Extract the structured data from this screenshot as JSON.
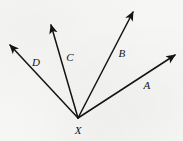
{
  "figure": {
    "width": 183,
    "height": 141,
    "background_color": "#f6f6f4",
    "line_color": "#141414",
    "label_color": "#141414",
    "line_width": 1.5
  },
  "vertex": {
    "label": "X",
    "x": 78,
    "y": 118,
    "label_x": 78,
    "label_y": 130
  },
  "rays": [
    {
      "label": "A",
      "from_x": 78,
      "from_y": 118,
      "to_x": 175,
      "to_y": 55,
      "label_x": 147,
      "label_y": 85,
      "direction": "up-right-shallow"
    },
    {
      "label": "B",
      "from_x": 78,
      "from_y": 118,
      "to_x": 133,
      "to_y": 12,
      "label_x": 122,
      "label_y": 53,
      "direction": "up-right-steep"
    },
    {
      "label": "C",
      "from_x": 78,
      "from_y": 118,
      "to_x": 51,
      "to_y": 25,
      "label_x": 70,
      "label_y": 57,
      "direction": "up-left-steep"
    },
    {
      "label": "D",
      "from_x": 78,
      "from_y": 118,
      "to_x": 10,
      "to_y": 45,
      "label_x": 36,
      "label_y": 62,
      "direction": "up-left-moderate"
    }
  ]
}
